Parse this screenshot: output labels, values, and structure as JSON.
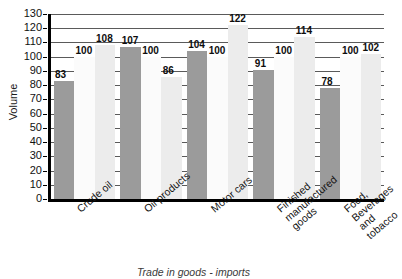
{
  "chart_data": {
    "type": "bar",
    "title": "",
    "caption": "Trade in goods - imports",
    "xlabel": "",
    "ylabel": "Volume",
    "ylim": [
      0,
      130
    ],
    "ytick_step": 10,
    "yticks": [
      0,
      10,
      20,
      30,
      40,
      50,
      60,
      70,
      80,
      90,
      100,
      110,
      120,
      130
    ],
    "grid": true,
    "legend": "none",
    "categories": [
      "Crude oil",
      "Oil products",
      "Motor cars",
      "Finished manufactured goods",
      "Food, Beverages and tobacco"
    ],
    "category_lines": [
      [
        "Crude oil"
      ],
      [
        "Oil products"
      ],
      [
        "Motor cars"
      ],
      [
        "Finished",
        "manufactured",
        "goods"
      ],
      [
        "Food,",
        "Beverages",
        "and tobacco"
      ]
    ],
    "series": [
      {
        "name": "series-1",
        "color": "#9b9b9b",
        "values": [
          83,
          107,
          104,
          91,
          78
        ]
      },
      {
        "name": "series-2",
        "color": "#fbfbfb",
        "values": [
          100,
          100,
          100,
          100,
          100
        ]
      },
      {
        "name": "series-3",
        "color": "#ececec",
        "values": [
          108,
          86,
          122,
          114,
          102
        ]
      }
    ],
    "bar_labels": [
      [
        "83",
        "100",
        "108"
      ],
      [
        "107",
        "100",
        "86"
      ],
      [
        "104",
        "100",
        "122"
      ],
      [
        "91",
        "100",
        "114"
      ],
      [
        "78",
        "100",
        "102"
      ]
    ]
  },
  "colors": {
    "axis": "#000000",
    "grid": "#5a5a5a",
    "text": "#111111",
    "background": "#ffffff"
  }
}
